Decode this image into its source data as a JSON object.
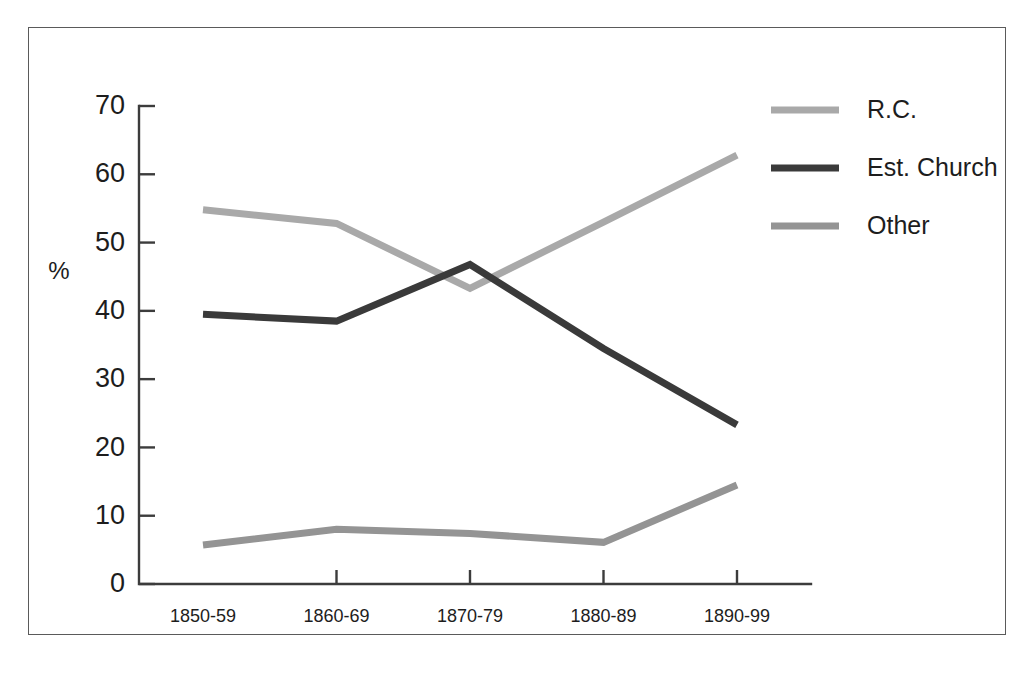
{
  "chart_data": {
    "type": "line",
    "title": "",
    "xlabel": "",
    "ylabel": "%",
    "categories": [
      "1850-59",
      "1860-69",
      "1870-79",
      "1880-89",
      "1890-99"
    ],
    "ylim": [
      0,
      70
    ],
    "yticks": [
      0,
      10,
      20,
      30,
      40,
      50,
      60,
      70
    ],
    "ytick_labels": [
      "0",
      "10",
      "20",
      "30",
      "40",
      "50",
      "60",
      "70"
    ],
    "grid": false,
    "legend_position": "top-right",
    "series": [
      {
        "name": "R.C.",
        "color": "#a9a9a9",
        "values": [
          54.8,
          52.8,
          43.3,
          53.0,
          62.8
        ]
      },
      {
        "name": "Est. Church",
        "color": "#3a3a3a",
        "values": [
          39.5,
          38.5,
          46.8,
          34.5,
          23.3
        ]
      },
      {
        "name": "Other",
        "color": "#949494",
        "values": [
          5.7,
          8.0,
          7.4,
          6.1,
          14.5
        ]
      }
    ]
  },
  "legend": {
    "entries": [
      {
        "label": "R.C.",
        "color": "#a9a9a9"
      },
      {
        "label": "Est. Church",
        "color": "#3a3a3a"
      },
      {
        "label": "Other",
        "color": "#949494"
      }
    ]
  },
  "axes": {
    "y_title": "%",
    "y_tick_labels": [
      "70",
      "60",
      "50",
      "40",
      "30",
      "20",
      "10",
      "0"
    ],
    "x_tick_labels": [
      "1850-59",
      "1860-69",
      "1870-79",
      "1880-89",
      "1890-99"
    ]
  },
  "colors": {
    "frame": "#5a5a5a",
    "axis": "#3c3c3c",
    "text": "#1d1d1d",
    "background": "#ffffff"
  }
}
